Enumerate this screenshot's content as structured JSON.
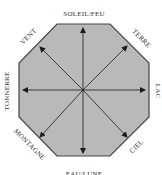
{
  "diagram": {
    "type": "bagua-octagon",
    "colors": {
      "fill": "#b9b9b9",
      "stroke": "#444444",
      "arrow": "#1a1a1a",
      "text": "#333333"
    },
    "labels": {
      "top": "SOLEIL/FEU",
      "top_right": "TERRE",
      "right": "LAC",
      "bottom_right": "CIEL",
      "bottom": "EAU/LUNE",
      "bottom_left": "MONTAGNE",
      "left": "TONNERRE",
      "top_left": "VENT"
    }
  }
}
